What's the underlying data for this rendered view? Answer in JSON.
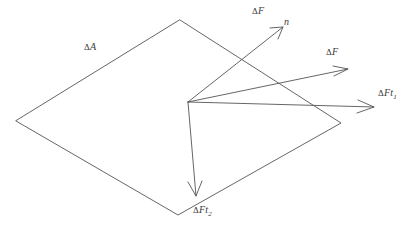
{
  "figure": {
    "background_color": "#ffffff",
    "line_color": "#555555",
    "text_color": "#3a3a3a",
    "width": 406,
    "height": 231
  },
  "surface": {
    "name": "area-element",
    "label": {
      "delta": "Δ",
      "symbol": "A"
    },
    "vertices": [
      {
        "x": 180,
        "y": 20
      },
      {
        "x": 341,
        "y": 123
      },
      {
        "x": 178,
        "y": 215
      },
      {
        "x": 16,
        "y": 121
      }
    ]
  },
  "origin": {
    "x": 188,
    "y": 102
  },
  "vectors": [
    {
      "name": "normal-force-vector",
      "tip": {
        "x": 283,
        "y": 27
      },
      "label": {
        "delta": "Δ",
        "symbol": "F",
        "subscript": ""
      }
    },
    {
      "name": "resultant-force-vector",
      "tip": {
        "x": 348,
        "y": 69
      },
      "label": {
        "delta": "Δ",
        "symbol": "F",
        "subscript": ""
      }
    },
    {
      "name": "tangential-force-vector-1",
      "tip": {
        "x": 374,
        "y": 107
      },
      "label": {
        "delta": "Δ",
        "symbol": "Ft",
        "subscript": "1"
      }
    },
    {
      "name": "tangential-force-vector-2",
      "tip": {
        "x": 196,
        "y": 196
      },
      "label": {
        "delta": "Δ",
        "symbol": "Ft",
        "subscript": "2"
      }
    }
  ],
  "normal_axis_label": {
    "name": "surface-normal-symbol",
    "symbol": "n"
  }
}
